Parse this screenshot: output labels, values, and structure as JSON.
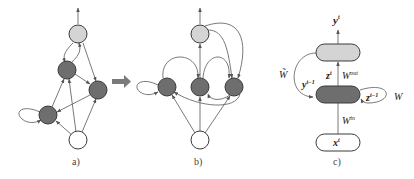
{
  "figure": {
    "panels": [
      {
        "id": "a",
        "caption": "a)"
      },
      {
        "id": "b",
        "caption": "b)"
      },
      {
        "id": "c",
        "caption": "c)"
      }
    ],
    "colors": {
      "output_node": "#d4d4d4",
      "hidden_node": "#6e6e6e",
      "input_node": "#ffffff",
      "edge": "#6a6a6a",
      "transform_arrow": "#7a7a7a"
    },
    "panel_c": {
      "output_label": "y",
      "output_sup": "t",
      "hidden_out_label": "z",
      "hidden_out_sup": "t",
      "w_out": "W",
      "w_out_sup": "out",
      "feedback_label": "y",
      "feedback_sup": "t−1",
      "w_tilde": "W̃",
      "self_loop_label": "z",
      "self_loop_sup": "t−1",
      "w_rec": "W",
      "w_in": "W",
      "w_in_sup": "in",
      "input_label": "x",
      "input_sup": "t"
    }
  }
}
